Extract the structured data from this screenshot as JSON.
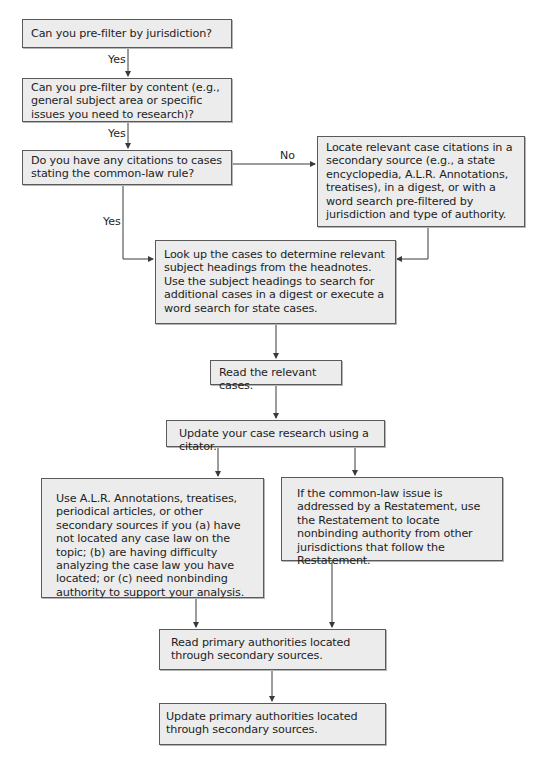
{
  "flowchart": {
    "nodes": {
      "n1": "Can you pre-filter by jurisdiction?",
      "n2": "Can you pre-filter by content (e.g., general subject area or specific issues you need to research)?",
      "n3": "Do you have any citations to cases stating the common-law rule?",
      "n4": "Locate relevant case citations in a secondary source (e.g., a state encyclopedia, A.L.R. Annotations, treatises), in a digest, or with a word search pre-filtered by jurisdiction and type of authority.",
      "n5": "Look up the cases to determine relevant subject headings from the headnotes. Use the subject headings to search for additional cases in a digest or execute a word search for state cases.",
      "n6": "Read the relevant cases.",
      "n7": "Update your case research using a citator.",
      "n8": "Use A.L.R. Annotations, treatises, periodical articles, or other secondary sources if you (a) have not located any case law on the topic; (b) are having difficulty analyzing the case law you have located; or (c) need nonbinding authority to support your analysis.",
      "n9": "If the common-law issue is addressed by a Restatement, use the Restatement to locate nonbinding authority from other jurisdictions that follow the Restatement.",
      "n10": "Read primary authorities located through secondary sources.",
      "n11": "Update primary authorities located through secondary sources."
    },
    "edge_labels": {
      "n1_n2": "Yes",
      "n2_n3": "Yes",
      "n3_n4": "No",
      "n3_n5": "Yes"
    },
    "colors": {
      "box_fill": "#ececec",
      "box_border": "#5a5a5a",
      "line": "#3a3a3a"
    }
  }
}
